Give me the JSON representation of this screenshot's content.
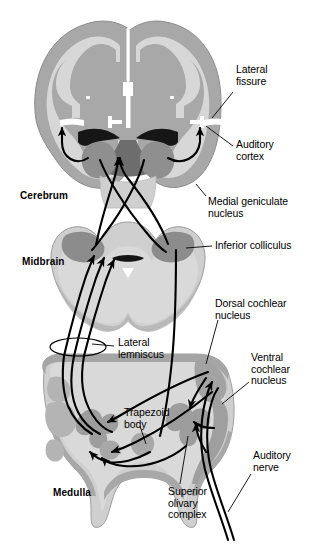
{
  "figure": {
    "palette": {
      "background": "#ffffff",
      "cortex_ribbon": "#a8a8a8",
      "white_matter": "#d7d7d7",
      "deep_gray": "#9a9a9a",
      "dark_structure": "#7d7d7d",
      "ventricle_dark": "#1a1a1a",
      "outline": "#6f6f6f",
      "pathway_stroke": "#000000",
      "leader_stroke": "#000000",
      "text": "#000000"
    }
  },
  "region_labels": [
    {
      "id": "cerebrum",
      "text": "Cerebrum",
      "x": 20,
      "y": 190
    },
    {
      "id": "midbrain",
      "text": "Midbrain",
      "x": 22,
      "y": 256
    },
    {
      "id": "medulla",
      "text": "Medulla",
      "x": 53,
      "y": 487
    }
  ],
  "structure_labels": [
    {
      "id": "lateral-fissure",
      "text": "Lateral\nfissure",
      "x": 236,
      "y": 64
    },
    {
      "id": "auditory-cortex",
      "text": "Auditory\ncortex",
      "x": 236,
      "y": 139
    },
    {
      "id": "medial-geniculate-nucleus",
      "text": "Medial geniculate\nnucleus",
      "x": 208,
      "y": 196
    },
    {
      "id": "inferior-colliculus",
      "text": "Inferior colliculus",
      "x": 215,
      "y": 245
    },
    {
      "id": "dorsal-cochlear-nucleus",
      "text": "Dorsal cochlear\nnucleus",
      "x": 215,
      "y": 303
    },
    {
      "id": "ventral-cochlear-nucleus",
      "text": "Ventral\ncochlear\nnucleus",
      "x": 251,
      "y": 357
    },
    {
      "id": "lateral-lemniscus",
      "text": "Lateral\nlemniscus",
      "x": 118,
      "y": 339
    },
    {
      "id": "trapezoid-body",
      "text": "Trapezoid\nbody",
      "x": 124,
      "y": 409
    },
    {
      "id": "auditory-nerve",
      "text": "Auditory\nnerve",
      "x": 253,
      "y": 455
    },
    {
      "id": "superior-olivary-complex",
      "text": "Superior\nolivary\ncomplex",
      "x": 168,
      "y": 489
    }
  ],
  "anatomy_parts": [
    {
      "id": "cerebrum-section",
      "name": "cerebrum-coronal-section"
    },
    {
      "id": "midbrain-section",
      "name": "midbrain-coronal-section"
    },
    {
      "id": "medulla-section",
      "name": "medulla-coronal-section"
    },
    {
      "id": "lateral-ventricles",
      "name": "lateral-ventricles"
    },
    {
      "id": "thalamus-mgn-left",
      "name": "medial-geniculate-nucleus-left"
    },
    {
      "id": "thalamus-mgn-right",
      "name": "medial-geniculate-nucleus-right"
    },
    {
      "id": "inferior-colliculus-left",
      "name": "inferior-colliculus-left"
    },
    {
      "id": "inferior-colliculus-right",
      "name": "inferior-colliculus-right"
    },
    {
      "id": "cerebral-aqueduct",
      "name": "cerebral-aqueduct"
    },
    {
      "id": "soc-left",
      "name": "superior-olivary-complex-left"
    },
    {
      "id": "soc-right",
      "name": "superior-olivary-complex-right"
    },
    {
      "id": "trapezoid-body-shape",
      "name": "trapezoid-body-structure"
    },
    {
      "id": "dcn-right",
      "name": "dorsal-cochlear-nucleus-structure"
    },
    {
      "id": "vcn-right",
      "name": "ventral-cochlear-nucleus-structure"
    },
    {
      "id": "ll-ellipse",
      "name": "lateral-lemniscus-bundle"
    }
  ],
  "pathways": [
    {
      "id": "path-cortex-left",
      "name": "thalamocortical-projection-left"
    },
    {
      "id": "path-cortex-right",
      "name": "thalamocortical-projection-right"
    },
    {
      "id": "path-ic-mgn-cross",
      "name": "colliculogeniculate-crossing-fibers"
    },
    {
      "id": "path-ll-ic",
      "name": "lateral-lemniscus-to-colliculus"
    },
    {
      "id": "path-cn-soc",
      "name": "cochlear-nucleus-to-olive"
    },
    {
      "id": "path-an",
      "name": "auditory-nerve-fibers"
    }
  ]
}
